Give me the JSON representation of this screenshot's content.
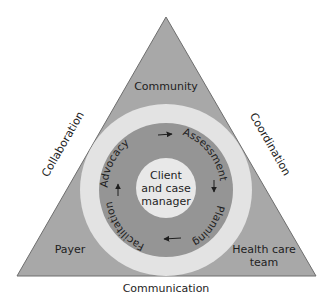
{
  "diagram": {
    "colors": {
      "triangle_fill": "#a8a8a8",
      "triangle_stroke": "#6e6e6e",
      "outer_ring": "#e3e3e3",
      "process_ring": "#959595",
      "center_circle": "#e8e8e8",
      "text": "#1e1e1e"
    },
    "corners": {
      "top": "Community",
      "bottom_left": "Payer",
      "bottom_right_line1": "Health care",
      "bottom_right_line2": "team"
    },
    "sides": {
      "left": "Collaboration",
      "right": "Coordination",
      "bottom": "Communication"
    },
    "center": {
      "line1": "Client",
      "line2": "and case",
      "line3": "manager"
    },
    "process_cycle": {
      "direction": "clockwise",
      "steps": [
        "Advocacy",
        "Assessment",
        "Planning",
        "Facilitation"
      ]
    }
  }
}
